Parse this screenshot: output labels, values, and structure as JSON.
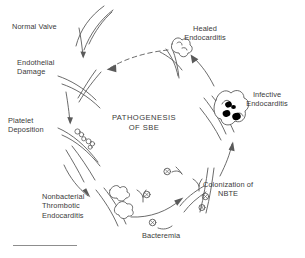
{
  "figure": {
    "title_lines": [
      "PATHOGENESIS",
      "OF SBE"
    ],
    "title_full": "PATHOGENESIS OF SBE",
    "footnote_rule": true
  },
  "labels": {
    "normal_valve": "Normal Valve",
    "endothelial_damage": "Endothelial\nDamage",
    "platelet_deposition": "Platelet\nDeposition",
    "nbte": "Nonbacterial\nThrombotic\nEndocarditis",
    "bacteremia": "Bacteremia",
    "colonization": "Colonization of\nNBTE",
    "infective_endocarditis": "Infective\nEndocarditis",
    "healed_endocarditis": "Healed\nEndocarditis"
  },
  "cycle": {
    "direction": "clockwise",
    "stages": [
      "Normal Valve",
      "Endothelial Damage",
      "Platelet Deposition",
      "Nonbacterial Thrombotic Endocarditis",
      "Colonization of NBTE",
      "Infective Endocarditis",
      "Healed Endocarditis"
    ],
    "input": "Bacteremia",
    "return_arrow": "Healed Endocarditis to Endothelial Damage (dashed)"
  },
  "colors": {
    "ink": "#3a3a3a",
    "line": "#5a5a5a",
    "background": "#ffffff",
    "vegetation_fill": "#ffffff",
    "bacteria_fill": "#000000"
  }
}
